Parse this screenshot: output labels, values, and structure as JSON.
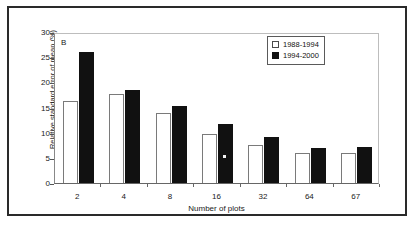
{
  "figure": {
    "panel_label": "B"
  },
  "legend": {
    "position": "top-right",
    "entries": [
      {
        "label": "1988-1994",
        "swatch": "open-square",
        "color": "#ffffff"
      },
      {
        "label": "1994-2000",
        "swatch": "filled-square",
        "color": "#111111"
      }
    ]
  },
  "chart_data": {
    "type": "bar",
    "title": "",
    "subtitle": "",
    "panel_label": "B",
    "xlabel": "Number of plots",
    "ylabel": "Relative standard error of mean (%)",
    "categories": [
      "2",
      "4",
      "8",
      "16",
      "32",
      "64",
      "67"
    ],
    "ylim": [
      0,
      30
    ],
    "yticks": [
      0,
      5,
      10,
      15,
      20,
      25,
      30
    ],
    "ytick_labels": [
      "0",
      "5",
      "10",
      "15",
      "20",
      "25",
      "30"
    ],
    "grid": false,
    "legend_position": "top-right",
    "series": [
      {
        "name": "1988-1994",
        "color": "#ffffff",
        "edge_color": "#7a7a7a",
        "values": [
          16.3,
          17.6,
          14.0,
          9.8,
          7.5,
          6.0,
          6.0
        ]
      },
      {
        "name": "1994-2000",
        "color": "#111111",
        "edge_color": "#111111",
        "values": [
          26.0,
          18.4,
          15.3,
          11.8,
          9.2,
          7.0,
          7.2
        ]
      }
    ],
    "annotations": [
      {
        "text": "B",
        "x": "2",
        "y": 28.5,
        "kind": "panel-label"
      }
    ]
  }
}
